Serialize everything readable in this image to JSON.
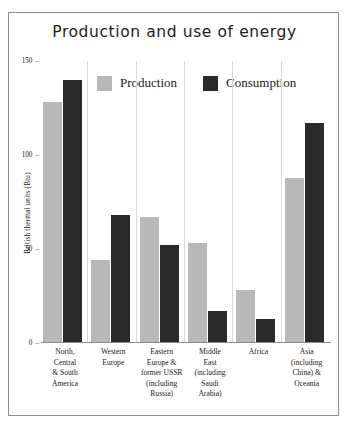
{
  "chart_data": {
    "type": "bar",
    "title": "Production and use of energy",
    "xlabel": "",
    "ylabel": "British thermal units (Btu)",
    "ylim": [
      0,
      150
    ],
    "yticks": [
      0,
      50,
      100,
      150
    ],
    "ytick_labels": [
      "0",
      "50",
      "100",
      "150"
    ],
    "grid": false,
    "legend_position": "top-center",
    "categories": [
      "North, Central & South America",
      "Western Europe",
      "Eastern Europe & former USSR (including Russia)",
      "Middle East (including Saudi Arabia)",
      "Africa",
      "Asia (including China) & Oceania"
    ],
    "category_lines": [
      [
        "North,",
        "Central",
        "& South",
        "America"
      ],
      [
        "Western",
        "Europe"
      ],
      [
        "Eastern",
        "Europe &",
        "former USSR",
        "(including",
        "Russia)"
      ],
      [
        "Middle",
        "East",
        "(including",
        "Saudi",
        "Arabia)"
      ],
      [
        "Africa"
      ],
      [
        "Asia",
        "(including",
        "China) &",
        "Oceania"
      ]
    ],
    "series": [
      {
        "name": "Production",
        "color": "#b8b8b8",
        "values": [
          128,
          44,
          67,
          53,
          28,
          88
        ]
      },
      {
        "name": "Consumption",
        "color": "#2a2a2a",
        "values": [
          140,
          68,
          52,
          17,
          13,
          117
        ]
      }
    ]
  },
  "legend": {
    "items": [
      {
        "label": "Production"
      },
      {
        "label": "Consumption"
      }
    ]
  },
  "tick_dash": "–"
}
